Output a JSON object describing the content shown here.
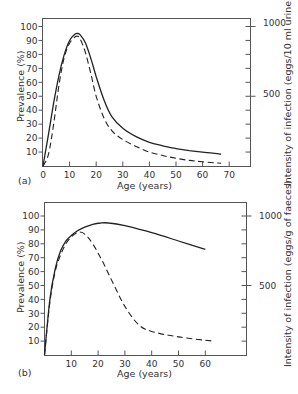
{
  "chart_data": [
    {
      "panel": "(a)",
      "type": "line",
      "title": "",
      "xlabel": "Age (years)",
      "ylabel": "Prevalence (%)",
      "y2label": "Intensity of infection (eggs/10 ml urine)",
      "xlim": [
        0,
        75
      ],
      "ylim": [
        0,
        105
      ],
      "y2lim": [
        0,
        1050
      ],
      "x_ticks": [
        0,
        10,
        20,
        30,
        40,
        50,
        60,
        70
      ],
      "y_ticks": [
        10,
        20,
        30,
        40,
        50,
        60,
        70,
        80,
        90,
        100
      ],
      "y2_ticks": [
        500,
        1000
      ],
      "grid": false,
      "series": [
        {
          "name": "Prevalence (%)",
          "style": "solid",
          "x": [
            0,
            2,
            4,
            6,
            8,
            10,
            12,
            13,
            14,
            16,
            18,
            20,
            23,
            26,
            30,
            35,
            40,
            45,
            50,
            55,
            60,
            67
          ],
          "y": [
            0,
            22,
            45,
            65,
            80,
            90,
            94.5,
            95,
            94,
            88,
            77,
            64,
            47,
            35,
            27,
            21,
            17,
            14.5,
            12.5,
            11,
            10,
            8.5
          ]
        },
        {
          "name": "Intensity of infection",
          "style": "dashed",
          "x": [
            0,
            2,
            4,
            6,
            8,
            10,
            12,
            13,
            14,
            16,
            18,
            20,
            23,
            26,
            30,
            35,
            40,
            45,
            50,
            55,
            60,
            67
          ],
          "y": [
            0,
            8,
            30,
            58,
            78,
            88,
            92.5,
            93,
            91,
            81,
            66,
            50,
            34,
            25,
            19,
            14,
            10,
            7.5,
            5.5,
            4,
            3,
            2
          ]
        }
      ]
    },
    {
      "panel": "(b)",
      "type": "line",
      "title": "",
      "xlabel": "Age (years)",
      "ylabel": "Prevalence (%)",
      "y2label": "Intensity of infection (eggs/g of faeces)",
      "xlim": [
        0,
        75
      ],
      "ylim": [
        0,
        105
      ],
      "y2lim": [
        0,
        1050
      ],
      "x_ticks": [
        10,
        20,
        30,
        40,
        50,
        60
      ],
      "y_ticks": [
        10,
        20,
        30,
        40,
        50,
        60,
        70,
        80,
        90,
        100
      ],
      "y2_ticks": [
        500,
        1000
      ],
      "grid": false,
      "series": [
        {
          "name": "Prevalence (%)",
          "style": "solid",
          "x": [
            0,
            2,
            4,
            6,
            8,
            10,
            12,
            15,
            18,
            21,
            24,
            30,
            40,
            50,
            60
          ],
          "y": [
            0,
            40,
            62,
            75,
            82,
            86,
            89,
            92,
            94,
            95,
            95,
            93,
            88,
            82,
            76
          ]
        },
        {
          "name": "Intensity of infection",
          "style": "dashed",
          "x": [
            0,
            2,
            4,
            6,
            8,
            10,
            12,
            13,
            15,
            18,
            22,
            26,
            30,
            35,
            40,
            50,
            63
          ],
          "y": [
            0,
            38,
            60,
            72,
            80,
            85,
            88,
            88.5,
            87,
            80,
            66,
            50,
            35,
            22,
            17,
            13,
            10
          ]
        }
      ]
    }
  ],
  "panels": {
    "a": {
      "label": "(a)",
      "xlabel": "Age (years)",
      "ylabel": "Prevalence (%)",
      "y2label": "Intensity of infection (eggs/10 ml urine)",
      "y2_1000": "1000",
      "y2_500": "500"
    },
    "b": {
      "label": "(b)",
      "xlabel": "Age (years)",
      "ylabel": "Prevalence (%)",
      "y2label": "Intensity of infection (eggs/g of faeces)",
      "y2_1000": "1000",
      "y2_500": "500"
    }
  }
}
